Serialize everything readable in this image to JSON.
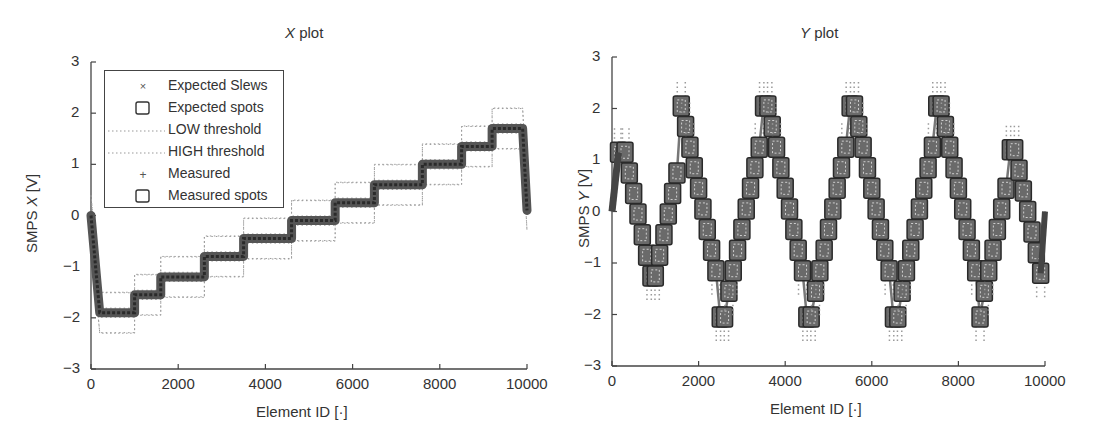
{
  "chart_data": [
    {
      "type": "line",
      "title": "X plot",
      "title_italic_part": "X",
      "title_rest": " plot",
      "xlabel": "Element ID [·]",
      "ylabel": "SMPS X [V]",
      "ylabel_parts": {
        "pre": "SMPS ",
        "italic": "X",
        "post": " [V]"
      },
      "xlim": [
        0,
        10000
      ],
      "ylim": [
        -3,
        3
      ],
      "xticks": [
        0,
        2000,
        4000,
        6000,
        8000,
        10000
      ],
      "yticks": [
        -3,
        -2,
        -1,
        0,
        1,
        2,
        3
      ],
      "legend_position": "upper left",
      "legend": [
        "Expected Slews",
        "Expected spots",
        "LOW threshold",
        "HIGH threshold",
        "Measured",
        "Measured spots"
      ],
      "threshold_offset": 0.4,
      "series": [
        {
          "name": "Measured / Expected (staircase)",
          "x": [
            0,
            200,
            1000,
            1000,
            1600,
            1600,
            2600,
            2600,
            3500,
            3500,
            4600,
            4600,
            5600,
            5600,
            6500,
            6500,
            7600,
            7600,
            8500,
            8500,
            9200,
            9200,
            9900,
            10000
          ],
          "y": [
            0,
            -1.9,
            -1.9,
            -1.55,
            -1.55,
            -1.2,
            -1.2,
            -0.8,
            -0.8,
            -0.45,
            -0.45,
            -0.1,
            -0.1,
            0.25,
            0.25,
            0.6,
            0.6,
            1.0,
            1.0,
            1.35,
            1.35,
            1.7,
            1.7,
            0.1
          ]
        }
      ]
    },
    {
      "type": "line",
      "title": "Y plot",
      "title_italic_part": "Y",
      "title_rest": " plot",
      "xlabel": "Element ID [·]",
      "ylabel": "SMPS Y [V]",
      "ylabel_parts": {
        "pre": "SMPS ",
        "italic": "Y",
        "post": " [V]"
      },
      "xlim": [
        0,
        10000
      ],
      "ylim": [
        -3,
        3
      ],
      "xticks": [
        0,
        2000,
        4000,
        6000,
        8000,
        10000
      ],
      "yticks": [
        -3,
        -2,
        -1,
        0,
        1,
        2,
        3
      ],
      "threshold_offset": 0.45,
      "series": [
        {
          "name": "Measured spots (triangle staircase)",
          "x": [
            0,
            150,
            300,
            400,
            500,
            600,
            700,
            800,
            900,
            1000,
            1100,
            1200,
            1300,
            1400,
            1500,
            1600,
            1700,
            1800,
            1900,
            2000,
            2100,
            2200,
            2300,
            2400,
            2500,
            2600,
            2700,
            2800,
            2900,
            3000,
            3100,
            3200,
            3300,
            3400,
            3500,
            3600,
            3700,
            3800,
            3900,
            4000,
            4100,
            4200,
            4300,
            4400,
            4500,
            4600,
            4700,
            4800,
            4900,
            5000,
            5100,
            5200,
            5300,
            5400,
            5500,
            5600,
            5700,
            5800,
            5900,
            6000,
            6100,
            6200,
            6300,
            6400,
            6500,
            6600,
            6700,
            6800,
            6900,
            7000,
            7100,
            7200,
            7300,
            7400,
            7500,
            7600,
            7700,
            7800,
            7900,
            8000,
            8100,
            8200,
            8300,
            8400,
            8500,
            8600,
            8700,
            8800,
            8900,
            9000,
            9100,
            9200,
            9300,
            9400,
            9500,
            9600,
            9700,
            9800,
            9900,
            10000
          ],
          "y": [
            0,
            1.15,
            1.15,
            0.75,
            0.35,
            -0.05,
            -0.45,
            -0.85,
            -1.25,
            -1.25,
            -0.85,
            -0.45,
            -0.05,
            0.35,
            0.75,
            2.05,
            1.65,
            1.25,
            0.85,
            0.45,
            0.05,
            -0.35,
            -0.75,
            -1.15,
            -2.05,
            -2.05,
            -1.55,
            -1.15,
            -0.75,
            -0.35,
            0.05,
            0.45,
            0.85,
            1.25,
            2.05,
            2.05,
            1.65,
            1.25,
            0.85,
            0.45,
            0.05,
            -0.35,
            -0.75,
            -1.15,
            -2.05,
            -2.05,
            -1.55,
            -1.15,
            -0.75,
            -0.35,
            0.05,
            0.45,
            0.85,
            1.25,
            2.05,
            2.05,
            1.65,
            1.25,
            0.85,
            0.45,
            0.05,
            -0.35,
            -0.75,
            -1.15,
            -2.05,
            -2.05,
            -1.55,
            -1.15,
            -0.75,
            -0.35,
            0.05,
            0.45,
            0.85,
            1.25,
            2.05,
            2.05,
            1.65,
            1.25,
            0.85,
            0.45,
            0.05,
            -0.35,
            -0.75,
            -1.15,
            -2.05,
            -1.55,
            -1.15,
            -0.75,
            -0.35,
            0.05,
            0.45,
            1.2,
            1.2,
            0.8,
            0.4,
            0.0,
            -0.4,
            -0.8,
            -1.2,
            0.0
          ]
        }
      ]
    }
  ],
  "colors": {
    "series": "#3a3a3a",
    "spot_fill": "#6a6a6a",
    "threshold": "#9a9a9a",
    "axis": "#444444",
    "text": "#333333"
  },
  "legend_icons": [
    "x-mark-icon",
    "square-icon",
    "dotted-line-icon",
    "dotted-line-icon",
    "plus-icon",
    "square-icon"
  ]
}
